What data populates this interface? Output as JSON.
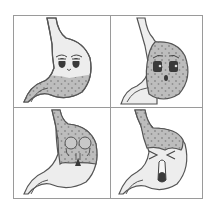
{
  "figure": {
    "panels": [
      {
        "id": "calm",
        "mood": "calm-sleepy",
        "fill_region": "lower"
      },
      {
        "id": "worried",
        "mood": "worried",
        "fill_region": "full"
      },
      {
        "id": "skull",
        "mood": "skull",
        "fill_region": "upper"
      },
      {
        "id": "pain",
        "mood": "pain-crying-out",
        "fill_region": "top"
      }
    ]
  },
  "colors": {
    "border": "#9a9a9a",
    "outline": "#555555",
    "stomach_fill": "#ededed",
    "content_fill": "#bdbdbd",
    "content_dots": "#8f8f8f",
    "face_dark": "#3a3a3a"
  }
}
